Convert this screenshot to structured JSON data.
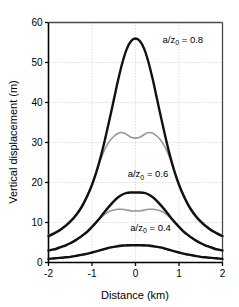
{
  "chart_data": {
    "type": "line",
    "title": "",
    "subtitle": "",
    "xlabel": "Distance (km)",
    "ylabel": "Vertical displacement (m)",
    "xlim": [
      -2,
      2
    ],
    "ylim": [
      0,
      60
    ],
    "xticks": [
      -2,
      -1,
      0,
      1,
      2
    ],
    "xtick_labels": [
      "-2",
      "-1",
      "0",
      "1",
      "2"
    ],
    "yticks": [
      0,
      10,
      20,
      30,
      40,
      50,
      60
    ],
    "ytick_labels": [
      "0",
      "10",
      "20",
      "30",
      "40",
      "50",
      "60"
    ],
    "grid": true,
    "grid_style": "dotted",
    "legend": "none",
    "annotations": [
      {
        "text": "a/z",
        "sub": "0",
        "suffix": " = 0.8",
        "x": 0.62,
        "y": 55.0
      },
      {
        "text": "a/z",
        "sub": "0",
        "suffix": " = 0.6",
        "x": -0.18,
        "y": 21.3
      },
      {
        "text": "a/z",
        "sub": "0",
        "suffix": " = 0.4",
        "x": -0.12,
        "y": 8.0
      }
    ],
    "x": [
      -2.0,
      -1.9,
      -1.8,
      -1.7,
      -1.6,
      -1.5,
      -1.4,
      -1.3,
      -1.2,
      -1.1,
      -1.0,
      -0.9,
      -0.8,
      -0.7,
      -0.6,
      -0.5,
      -0.4,
      -0.3,
      -0.2,
      -0.1,
      0.0,
      0.1,
      0.2,
      0.3,
      0.4,
      0.5,
      0.6,
      0.7,
      0.8,
      0.9,
      1.0,
      1.1,
      1.2,
      1.3,
      1.4,
      1.5,
      1.6,
      1.7,
      1.8,
      1.9,
      2.0
    ],
    "series": [
      {
        "name": "a/z0 = 0.8 black",
        "color": "#111111",
        "width": 2.4,
        "values": [
          6.6,
          7.1,
          7.7,
          8.4,
          9.2,
          10.2,
          11.4,
          12.8,
          14.6,
          16.8,
          19.4,
          22.6,
          26.4,
          30.8,
          35.6,
          40.6,
          45.6,
          50.0,
          53.4,
          55.4,
          56.0,
          55.4,
          53.4,
          50.0,
          45.6,
          40.6,
          35.6,
          30.8,
          26.4,
          22.6,
          19.4,
          16.8,
          14.6,
          12.8,
          11.4,
          10.2,
          9.2,
          8.4,
          7.7,
          7.1,
          6.6
        ]
      },
      {
        "name": "a/z0 = 0.8 gray",
        "color": "#999999",
        "width": 1.6,
        "values": [
          6.8,
          7.3,
          7.9,
          8.6,
          9.4,
          10.4,
          11.6,
          13.1,
          14.9,
          17.1,
          19.7,
          22.7,
          25.8,
          28.4,
          30.3,
          31.5,
          32.3,
          32.5,
          32.0,
          31.3,
          31.1,
          31.3,
          32.0,
          32.5,
          32.3,
          31.5,
          30.3,
          28.4,
          25.8,
          22.7,
          19.7,
          17.1,
          14.9,
          13.1,
          11.6,
          10.4,
          9.4,
          8.6,
          7.9,
          7.3,
          6.8
        ]
      },
      {
        "name": "a/z0 = 0.6 black",
        "color": "#111111",
        "width": 2.4,
        "values": [
          3.0,
          3.2,
          3.5,
          3.9,
          4.3,
          4.8,
          5.4,
          6.1,
          6.9,
          7.8,
          8.9,
          10.1,
          11.4,
          12.8,
          14.1,
          15.3,
          16.3,
          17.0,
          17.4,
          17.5,
          17.5,
          17.5,
          17.4,
          17.0,
          16.3,
          15.3,
          14.1,
          12.8,
          11.4,
          10.1,
          8.9,
          7.8,
          6.9,
          6.1,
          5.4,
          4.8,
          4.3,
          3.9,
          3.5,
          3.2,
          3.0
        ]
      },
      {
        "name": "a/z0 = 0.6 gray",
        "color": "#999999",
        "width": 1.6,
        "values": [
          3.1,
          3.3,
          3.6,
          4.0,
          4.4,
          4.9,
          5.5,
          6.2,
          7.0,
          7.9,
          9.0,
          10.1,
          11.2,
          12.1,
          12.8,
          13.1,
          13.3,
          13.3,
          13.1,
          12.9,
          12.9,
          12.9,
          13.1,
          13.3,
          13.3,
          13.1,
          12.8,
          12.1,
          11.2,
          10.1,
          9.0,
          7.9,
          7.0,
          6.2,
          5.5,
          4.9,
          4.4,
          4.0,
          3.6,
          3.3,
          3.1
        ]
      },
      {
        "name": "a/z0 = 0.4 black",
        "color": "#111111",
        "width": 2.4,
        "values": [
          0.9,
          1.0,
          1.1,
          1.2,
          1.3,
          1.4,
          1.6,
          1.8,
          2.0,
          2.2,
          2.5,
          2.8,
          3.1,
          3.4,
          3.7,
          3.9,
          4.1,
          4.25,
          4.3,
          4.35,
          4.35,
          4.35,
          4.3,
          4.25,
          4.1,
          3.9,
          3.7,
          3.4,
          3.1,
          2.8,
          2.5,
          2.2,
          2.0,
          1.8,
          1.6,
          1.4,
          1.3,
          1.2,
          1.1,
          1.0,
          0.9
        ]
      },
      {
        "name": "a/z0 = 0.4 gray",
        "color": "#999999",
        "width": 1.4,
        "values": [
          0.9,
          1.0,
          1.1,
          1.2,
          1.3,
          1.45,
          1.6,
          1.8,
          2.0,
          2.25,
          2.5,
          2.8,
          3.1,
          3.35,
          3.6,
          3.8,
          3.95,
          4.05,
          4.1,
          4.1,
          4.08,
          4.1,
          4.1,
          4.05,
          3.95,
          3.8,
          3.6,
          3.35,
          3.1,
          2.8,
          2.5,
          2.25,
          2.0,
          1.8,
          1.6,
          1.45,
          1.3,
          1.2,
          1.1,
          1.0,
          0.9
        ]
      }
    ]
  },
  "colors": {
    "axis": "#000000",
    "grid": "#b9b9b9",
    "primary_curve": "#111111",
    "secondary_curve": "#999999",
    "background": "#ffffff"
  }
}
